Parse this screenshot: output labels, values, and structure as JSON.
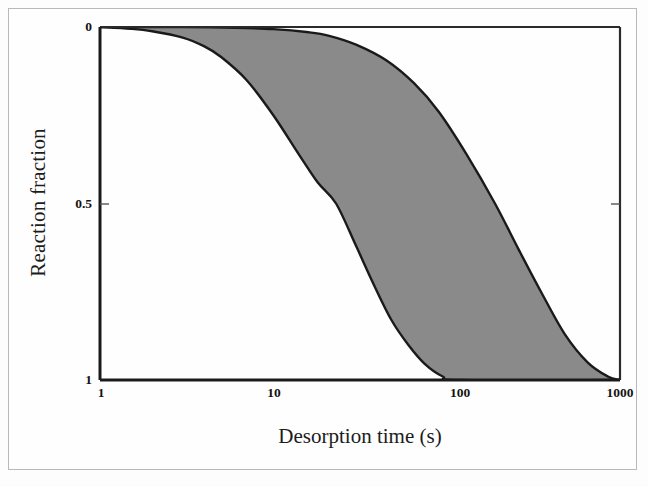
{
  "chart_data": {
    "type": "area",
    "title": "",
    "xlabel": "Desorption time (s)",
    "ylabel": "Reaction fraction",
    "xscale": "log",
    "xlim": [
      1,
      1000
    ],
    "ylim": [
      0,
      1
    ],
    "y_inverted": true,
    "grid": false,
    "legend": null,
    "xticks": [
      1,
      10,
      100,
      1000
    ],
    "xtick_labels": [
      "1",
      "10",
      "100",
      "1000"
    ],
    "yticks": [
      0,
      0.5,
      1
    ],
    "ytick_labels": [
      "0",
      "0.5",
      "1"
    ],
    "band_fill_color": "#8a8a8a",
    "curve_color": "#1a1a1a",
    "series": [
      {
        "name": "fast boundary",
        "role": "lower-time envelope",
        "t50": 23,
        "x": [
          1,
          1.5,
          2,
          3,
          4,
          5,
          7,
          10,
          14,
          18,
          23,
          30,
          38,
          48,
          60,
          75,
          95,
          120,
          1000
        ],
        "values": [
          0.0,
          0.005,
          0.012,
          0.03,
          0.055,
          0.085,
          0.15,
          0.25,
          0.36,
          0.44,
          0.5,
          0.62,
          0.73,
          0.83,
          0.9,
          0.955,
          0.99,
          1.0,
          1.0
        ]
      },
      {
        "name": "slow boundary",
        "role": "upper-time envelope",
        "t50": 190,
        "x": [
          1,
          3,
          6,
          10,
          16,
          21,
          30,
          45,
          65,
          90,
          130,
          190,
          260,
          350,
          480,
          650,
          850,
          1000
        ],
        "values": [
          0.0,
          0.0,
          0.002,
          0.006,
          0.015,
          0.025,
          0.05,
          0.095,
          0.16,
          0.24,
          0.36,
          0.5,
          0.63,
          0.75,
          0.87,
          0.95,
          0.99,
          1.0
        ]
      }
    ]
  },
  "axes": {
    "x_title": "Desorption time (s)",
    "y_title": "Reaction fraction",
    "x_ticks": [
      {
        "label": "1",
        "left": 100
      },
      {
        "label": "10",
        "left": 273
      },
      {
        "label": "100",
        "left": 447
      },
      {
        "label": "1000",
        "left": 620
      }
    ],
    "y_ticks": [
      {
        "label": "0",
        "top": 27,
        "right": 92
      },
      {
        "label": "0.5",
        "top": 204,
        "right": 92
      },
      {
        "label": "1",
        "top": 380,
        "right": 92
      }
    ]
  }
}
